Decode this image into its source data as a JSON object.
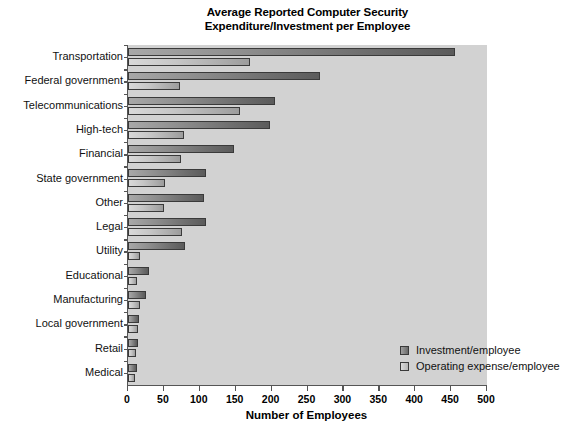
{
  "chart_data": {
    "type": "bar",
    "orientation": "horizontal",
    "title": "Average Reported Computer Security Expenditure/Investment per Employee",
    "title_lines": [
      "Average Reported Computer Security",
      "Expenditure/Investment per Employee"
    ],
    "xlabel": "Number of Employees",
    "ylabel": "",
    "xlim": [
      0,
      500
    ],
    "xticks": [
      0,
      50,
      100,
      150,
      200,
      250,
      300,
      350,
      400,
      450,
      500
    ],
    "xtick_labels": [
      "0",
      "50",
      "100",
      "150",
      "200",
      "250",
      "300",
      "350",
      "400",
      "450",
      "500"
    ],
    "grid": false,
    "legend_position": "center-right-inside",
    "categories": [
      "Transportation",
      "Federal government",
      "Telecommunications",
      "High-tech",
      "Financial",
      "State government",
      "Other",
      "Legal",
      "Utility",
      "Educational",
      "Manufacturing",
      "Local government",
      "Retail",
      "Medical"
    ],
    "series": [
      {
        "name": "Investment/employee",
        "color": "#6d6d6d",
        "values": [
          455,
          268,
          205,
          198,
          147,
          109,
          106,
          108,
          79,
          29,
          25,
          16,
          14,
          13
        ]
      },
      {
        "name": "Operating expense/employee",
        "color": "#c0c0c0",
        "values": [
          170,
          72,
          156,
          78,
          74,
          52,
          50,
          75,
          17,
          12,
          17,
          14,
          11,
          10
        ]
      }
    ]
  },
  "colors": {
    "plot_background": "#d2d2d2",
    "axis": "#555555",
    "page_background": "#ffffff",
    "text": "#000000"
  }
}
